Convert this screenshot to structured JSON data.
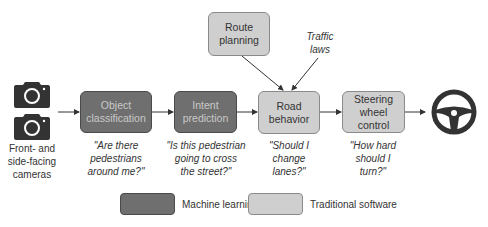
{
  "inputs": {
    "cameras_label": "Front- and side-facing cameras",
    "cameras_label_lines": [
      "Front- and",
      "side-facing",
      "cameras"
    ]
  },
  "nodes": {
    "object_classification": {
      "label_lines": [
        "Object",
        "classification"
      ],
      "type": "Machine learning",
      "question_lines": [
        "\"Are there",
        "pedestrians",
        "around me?\""
      ]
    },
    "intent_prediction": {
      "label_lines": [
        "Intent",
        "prediction"
      ],
      "type": "Machine learning",
      "question_lines": [
        "\"Is this pedestrian",
        "going to cross",
        "the street?\""
      ]
    },
    "road_behavior": {
      "label_lines": [
        "Road",
        "behavior"
      ],
      "type": "Traditional software",
      "question_lines": [
        "\"Should I",
        "change",
        "lanes?\""
      ]
    },
    "steering_wheel_control": {
      "label_lines": [
        "Steering",
        "wheel control"
      ],
      "type": "Traditional software",
      "question_lines": [
        "\"How hard",
        "should I",
        "turn?\""
      ]
    },
    "route_planning": {
      "label_lines": [
        "Route",
        "planning"
      ],
      "type": "Traditional software"
    }
  },
  "annotations": {
    "traffic_laws_lines": [
      "Traffic",
      "laws"
    ]
  },
  "legend": {
    "items": [
      {
        "label": "Machine learning",
        "color": "#6f6f6f"
      },
      {
        "label": "Traditional software",
        "color": "#cfcfcf"
      }
    ]
  },
  "colors": {
    "ml_fill": "#6f6f6f",
    "traditional_fill": "#cfcfcf",
    "icon": "#333333"
  }
}
